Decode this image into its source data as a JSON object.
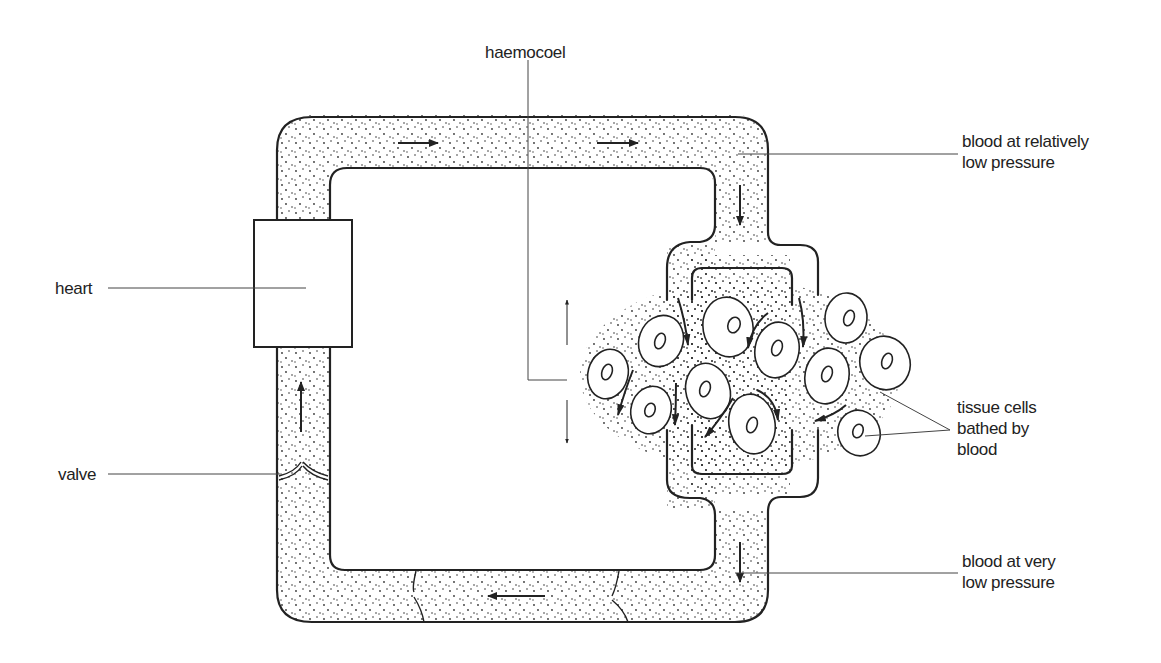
{
  "diagram": {
    "type": "open circulatory system",
    "labels": {
      "haemocoel": "haemocoel",
      "heart": "heart",
      "valve": "valve",
      "blood_high": [
        "blood at relatively",
        "low pressure"
      ],
      "tissue_cells": [
        "tissue cells",
        "bathed by",
        "blood"
      ],
      "blood_low": [
        "blood at very",
        "low pressure"
      ]
    },
    "flow_direction": "clockwise: heart → top vessel → tissue haemocoel → bottom vessel → heart",
    "colors": {
      "ink": "#222222",
      "background": "#ffffff"
    }
  }
}
